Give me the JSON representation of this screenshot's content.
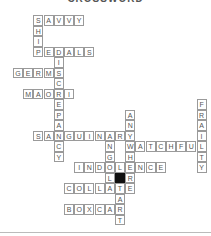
{
  "puzzle": {
    "title": "CROSSWORD",
    "cell_width": 10.2,
    "cell_height": 10.5,
    "origin_x": 13,
    "origin_y": 15,
    "words": [
      {
        "answer": "SAVVY",
        "row": 0,
        "col": 2,
        "dir": "across"
      },
      {
        "answer": "SHIP",
        "row": 0,
        "col": 2,
        "dir": "down"
      },
      {
        "answer": "PEDALS",
        "row": 3,
        "col": 2,
        "dir": "across"
      },
      {
        "answer": "DISCREPANCY",
        "row": 3,
        "col": 4,
        "dir": "down"
      },
      {
        "answer": "GERMS",
        "row": 5,
        "col": 0,
        "dir": "across"
      },
      {
        "answer": "MAORI",
        "row": 7,
        "col": 1,
        "dir": "across"
      },
      {
        "answer": "FRAILTY",
        "row": 8,
        "col": 18,
        "dir": "down"
      },
      {
        "answer": "ANYWHERE",
        "row": 9,
        "col": 11,
        "dir": "down"
      },
      {
        "answer": "SANGUINARY",
        "row": 11,
        "col": 2,
        "dir": "across"
      },
      {
        "answer": "ANGOLA",
        "row": 11,
        "col": 9,
        "dir": "down"
      },
      {
        "answer": "WATCHFUL",
        "row": 12,
        "col": 11,
        "dir": "across"
      },
      {
        "answer": "INDOLENCE",
        "row": 14,
        "col": 6,
        "dir": "across"
      },
      {
        "answer": "COLLATE",
        "row": 16,
        "col": 5,
        "dir": "across"
      },
      {
        "answer": "TART",
        "row": 16,
        "col": 10,
        "dir": "down"
      },
      {
        "answer": "BOXCAR",
        "row": 18,
        "col": 5,
        "dir": "across"
      }
    ],
    "blocks": [
      {
        "row": 15,
        "col": 10
      }
    ],
    "colors": {
      "letter": "#555555",
      "border": "#9a9a9a",
      "block": "#111111"
    }
  }
}
